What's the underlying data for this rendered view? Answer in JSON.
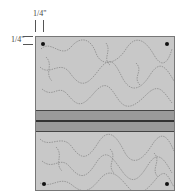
{
  "diagram": {
    "title": "",
    "measurements": {
      "top_allowance": "1/4\"",
      "left_allowance": "1/4\""
    },
    "panel": {
      "fill_color": "#c8c8c8",
      "pattern": "stipple-meander-quilting",
      "corner_markers": [
        "top-left",
        "top-right",
        "bottom-left",
        "bottom-right"
      ]
    },
    "band": {
      "description": "seam strip with stitched center line",
      "fill_color": "#9a9a9a",
      "seam_color": "#333333"
    }
  }
}
